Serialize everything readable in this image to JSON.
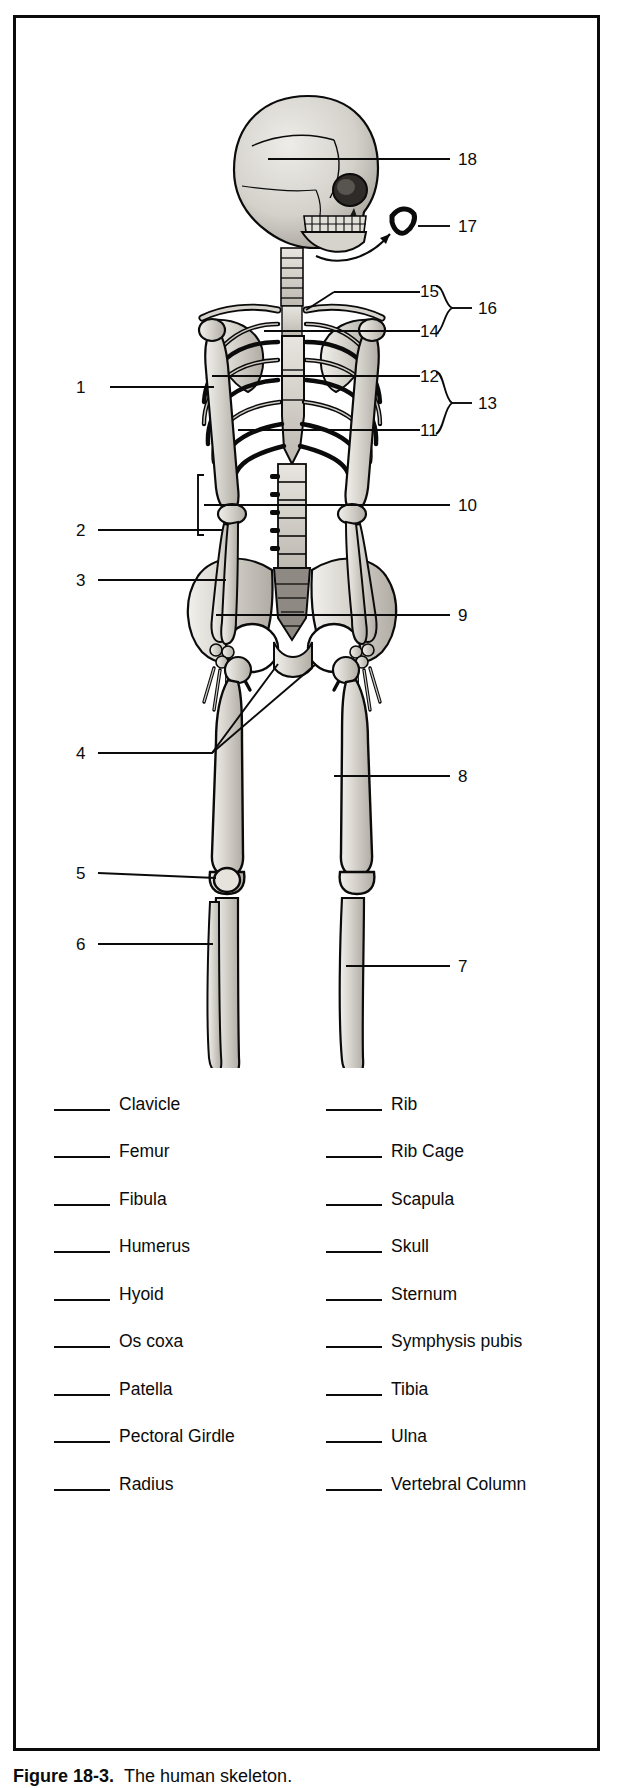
{
  "figure": {
    "caption_label": "Figure 18-3.",
    "caption_text": "The human skeleton."
  },
  "diagram": {
    "number_labels": [
      {
        "id": "1",
        "value": "1",
        "side": "left",
        "x": 78,
        "y": 369,
        "leader_to_x": 196,
        "leader_to_y": 369
      },
      {
        "id": "2",
        "value": "2",
        "side": "left",
        "x": 64,
        "y": 518,
        "leader_to_x": 190,
        "leader_to_y": 512
      },
      {
        "id": "3",
        "value": "3",
        "side": "left",
        "x": 64,
        "y": 568,
        "leader_to_x": 184,
        "leader_to_y": 562
      },
      {
        "id": "4",
        "value": "4",
        "side": "left",
        "x": 64,
        "y": 735,
        "leader_to_x": 196,
        "leader_to_y": 735
      },
      {
        "id": "5",
        "value": "5",
        "side": "left",
        "x": 64,
        "y": 849,
        "leader_to_x": 172,
        "leader_to_y": 849
      },
      {
        "id": "6",
        "value": "6",
        "side": "left",
        "x": 64,
        "y": 920,
        "leader_to_x": 162,
        "leader_to_y": 920
      },
      {
        "id": "7",
        "value": "7",
        "side": "right",
        "x": 448,
        "y": 948,
        "leader_to_x": 320,
        "leader_to_y": 948
      },
      {
        "id": "8",
        "value": "8",
        "side": "right",
        "x": 448,
        "y": 758,
        "leader_to_x": 318,
        "leader_to_y": 758
      },
      {
        "id": "9",
        "value": "9",
        "side": "right",
        "x": 448,
        "y": 597,
        "leader_to_x": 200,
        "leader_to_y": 597
      },
      {
        "id": "10",
        "value": "10",
        "side": "right",
        "x": 443,
        "y": 487,
        "leader_to_x": 188,
        "leader_to_y": 487
      },
      {
        "id": "11",
        "value": "11",
        "side": "right",
        "x": 410,
        "y": 417,
        "leader_to_x": 222,
        "leader_to_y": 412
      },
      {
        "id": "12",
        "value": "12",
        "side": "right",
        "x": 410,
        "y": 364,
        "leader_to_x": 196,
        "leader_to_y": 358
      },
      {
        "id": "13",
        "value": "13",
        "side": "right",
        "x": 463,
        "y": 390,
        "leader_to_x": 443,
        "leader_to_y": 390
      },
      {
        "id": "14",
        "value": "14",
        "side": "right",
        "x": 410,
        "y": 320,
        "leader_to_x": 248,
        "leader_to_y": 313
      },
      {
        "id": "15",
        "value": "15",
        "side": "right",
        "x": 410,
        "y": 272,
        "leader_to_x": 290,
        "leader_to_y": 292
      },
      {
        "id": "16",
        "value": "16",
        "side": "right",
        "x": 463,
        "y": 296,
        "leader_to_x": 443,
        "leader_to_y": 296
      },
      {
        "id": "17",
        "value": "17",
        "side": "right",
        "x": 443,
        "y": 208,
        "leader_to_x": 396,
        "leader_to_y": 208
      },
      {
        "id": "18",
        "value": "18",
        "side": "right",
        "x": 443,
        "y": 141,
        "leader_to_x": 252,
        "leader_to_y": 141
      }
    ],
    "braces": [
      {
        "id": "brace-13",
        "groups": [
          "12",
          "11"
        ],
        "label": "13"
      },
      {
        "id": "brace-16",
        "groups": [
          "15",
          "14"
        ],
        "label": "16"
      }
    ]
  },
  "word_list": {
    "left_column": [
      {
        "term": "Clavicle"
      },
      {
        "term": "Femur"
      },
      {
        "term": "Fibula"
      },
      {
        "term": "Humerus"
      },
      {
        "term": "Hyoid"
      },
      {
        "term": "Os coxa"
      },
      {
        "term": "Patella"
      },
      {
        "term": "Pectoral Girdle"
      },
      {
        "term": "Radius"
      }
    ],
    "right_column": [
      {
        "term": "Rib"
      },
      {
        "term": "Rib Cage"
      },
      {
        "term": "Scapula"
      },
      {
        "term": "Skull"
      },
      {
        "term": "Sternum"
      },
      {
        "term": "Symphysis pubis"
      },
      {
        "term": "Tibia"
      },
      {
        "term": "Ulna"
      },
      {
        "term": "Vertebral Column"
      }
    ]
  },
  "colors": {
    "ink": "#0b0b0b",
    "bone_fill": "#d8d5cf",
    "bone_shade": "#b3afa8",
    "paper": "#ffffff"
  }
}
